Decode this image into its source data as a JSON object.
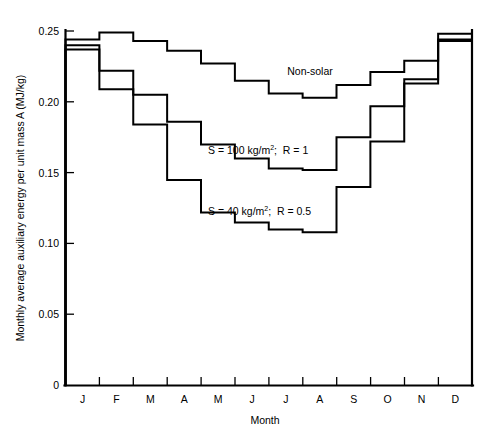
{
  "chart_data": {
    "type": "line",
    "subtype": "step-post",
    "title": "",
    "xlabel": "Month",
    "ylabel": "Monthly average auxiliary energy per unit mass A (MJ/kg)",
    "categories": [
      "J",
      "F",
      "M",
      "A",
      "M",
      "J",
      "J",
      "A",
      "S",
      "O",
      "N",
      "D"
    ],
    "category_names": [
      "January",
      "February",
      "March",
      "April",
      "May",
      "June",
      "July",
      "August",
      "September",
      "October",
      "November",
      "December"
    ],
    "ylim": [
      0,
      0.25
    ],
    "xlim": [
      0,
      12
    ],
    "y_ticks": [
      0,
      0.05,
      0.1,
      0.15,
      0.2,
      0.25
    ],
    "y_tick_labels": [
      "0",
      "0.05",
      "0.10",
      "0.15",
      "0.20",
      "0.25"
    ],
    "x_tick_labels": [
      "J",
      "F",
      "M",
      "A",
      "M",
      "J",
      "J",
      "A",
      "S",
      "O",
      "N",
      "D"
    ],
    "grid": false,
    "legend_position": "inline-annotations",
    "series": [
      {
        "name": "Non-solar",
        "label": "Non-solar",
        "values": [
          0.244,
          0.249,
          0.243,
          0.236,
          0.227,
          0.215,
          0.206,
          0.203,
          0.212,
          0.221,
          0.229,
          0.248
        ]
      },
      {
        "name": "S = 100 kg/m2 ; R = 1",
        "label": "S = 100 kg/m",
        "label_sup": "2",
        "label_tail": " ;  R = 1",
        "values": [
          0.24,
          0.222,
          0.205,
          0.186,
          0.17,
          0.16,
          0.153,
          0.152,
          0.175,
          0.197,
          0.216,
          0.244
        ]
      },
      {
        "name": "S = 40 kg/m2 ; R = 0.5",
        "label": "S = 40 kg/m",
        "label_sup": "2",
        "label_tail": " ;  R = 0.5",
        "values": [
          0.237,
          0.209,
          0.184,
          0.145,
          0.122,
          0.115,
          0.11,
          0.108,
          0.14,
          0.172,
          0.213,
          0.243
        ]
      }
    ],
    "annotations": [
      {
        "text": "Non-solar",
        "x_px": 310,
        "y_px": 71
      },
      {
        "text": "S = 100 kg/m2 ;  R = 1",
        "x_px": 208,
        "y_px": 150
      },
      {
        "text": "S = 40 kg/m2 ;  R = 0.5",
        "x_px": 208,
        "y_px": 211
      }
    ]
  },
  "axes": {
    "y_title": "Monthly average auxiliary energy per unit mass A (MJ/kg)",
    "x_title": "Month",
    "y_tick_labels": [
      "0.25",
      "0.20",
      "0.15",
      "0.10",
      "0.05",
      "0"
    ],
    "x_tick_labels": [
      "J",
      "F",
      "M",
      "A",
      "M",
      "J",
      "J",
      "A",
      "S",
      "O",
      "N",
      "D"
    ]
  },
  "annotations": {
    "nonsolar": "Non-solar",
    "s100_head": "S = 100 kg/m",
    "s100_sup": "2",
    "s100_tail": ";  R = 1",
    "s40_head": "S = 40 kg/m",
    "s40_sup": "2",
    "s40_tail": ";  R = 0.5"
  },
  "colors": {
    "line": "#000000",
    "background": "#ffffff",
    "text": "#000000"
  }
}
